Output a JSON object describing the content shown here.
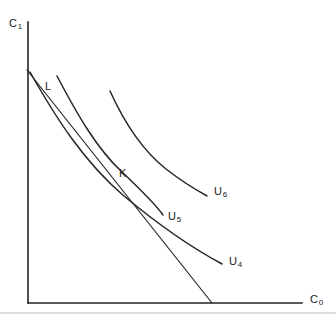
{
  "figure": {
    "type": "economics-indifference-curve-diagram",
    "background_color": "#ffffff",
    "line_color": "#262626",
    "axis_color": "#222222"
  },
  "axes": {
    "y_label": "C",
    "y_label_sub": "1",
    "x_label": "C",
    "x_label_sub": "0",
    "origin": {
      "x": 28,
      "y": 303
    },
    "y_axis_top": {
      "x": 28,
      "y": 22
    },
    "x_axis_right": {
      "x": 302,
      "y": 303
    }
  },
  "points": [
    {
      "name": "K",
      "label": "K",
      "x": 119,
      "y": 168
    },
    {
      "name": "L",
      "label": "L",
      "x": 45,
      "y": 81
    }
  ],
  "curves": [
    {
      "name": "U4",
      "label": "U",
      "label_sub": "4",
      "label_x": 229,
      "label_y": 256,
      "path": "M 30,72 C 56,118 84,162 124,196 C 160,226 196,250 222,264"
    },
    {
      "name": "U5",
      "label": "U",
      "label_sub": "5",
      "label_x": 168,
      "label_y": 211,
      "path": "M 57,76 C 76,112 96,148 122,172 C 141,190 156,205 163,215"
    },
    {
      "name": "U6",
      "label": "U",
      "label_sub": "6",
      "label_x": 214,
      "label_y": 186,
      "path": "M 110,91 C 124,122 142,150 166,169 C 184,183 198,191 207,196"
    }
  ],
  "budget_line": {
    "name": "budget-line",
    "from": {
      "x": 27,
      "y": 70
    },
    "to": {
      "x": 212,
      "y": 303
    }
  },
  "caption": {
    "rule_visible": true
  }
}
